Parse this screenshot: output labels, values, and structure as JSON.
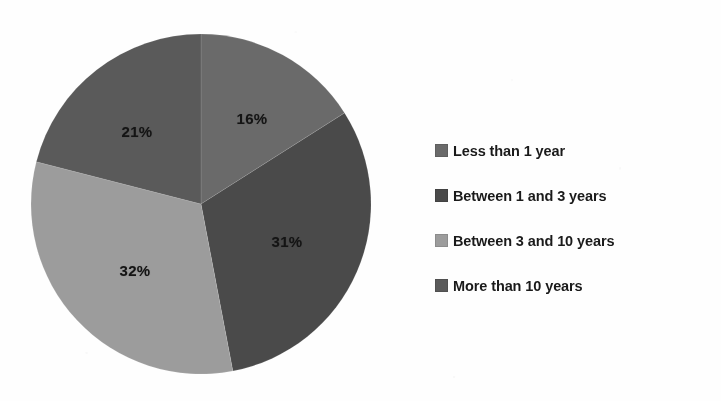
{
  "chart_data": {
    "type": "pie",
    "title": "",
    "subtitle": "",
    "xlabel": "",
    "ylabel": "",
    "grid": false,
    "legend_position": "right",
    "start_angle_deg": 0,
    "direction": "clockwise",
    "unit": "%",
    "categories": [
      "Less than 1 year",
      "Between 1 and 3 years",
      "Between 3 and 10 years",
      "More than 10 years"
    ],
    "values": [
      16,
      31,
      32,
      21
    ],
    "data_labels": [
      "16%",
      "31%",
      "32%",
      "21%"
    ],
    "colors": [
      "#6a6a6a",
      "#4a4a4a",
      "#9c9c9c",
      "#5a5a5a"
    ],
    "slices": [
      {
        "label": "Less than 1 year",
        "value": 16,
        "data_label": "16%",
        "color": "#6a6a6a",
        "start_angle_deg": 0,
        "end_angle_deg": 57.6,
        "label_x": 252,
        "label_y": 118
      },
      {
        "label": "Between 1 and 3 years",
        "value": 31,
        "data_label": "31%",
        "color": "#4a4a4a",
        "start_angle_deg": 57.6,
        "end_angle_deg": 169.2,
        "label_x": 287,
        "label_y": 241
      },
      {
        "label": "Between 3 and 10 years",
        "value": 32,
        "data_label": "32%",
        "color": "#9c9c9c",
        "start_angle_deg": 169.2,
        "end_angle_deg": 284.4,
        "label_x": 135,
        "label_y": 270
      },
      {
        "label": "More than 10 years",
        "value": 21,
        "data_label": "21%",
        "color": "#5a5a5a",
        "start_angle_deg": 284.4,
        "end_angle_deg": 360,
        "label_x": 137,
        "label_y": 131
      }
    ],
    "geometry": {
      "center_x": 201,
      "center_y": 204,
      "radius": 170
    }
  },
  "legend": {
    "items": [
      {
        "label": "Less than 1 year",
        "color": "#6a6a6a"
      },
      {
        "label": "Between 1 and 3 years",
        "color": "#4a4a4a"
      },
      {
        "label": "Between 3 and 10 years",
        "color": "#9c9c9c"
      },
      {
        "label": "More than 10 years",
        "color": "#5a5a5a"
      }
    ]
  },
  "page": {
    "background": "#fefefe",
    "text_color": "#1a1a1a"
  }
}
